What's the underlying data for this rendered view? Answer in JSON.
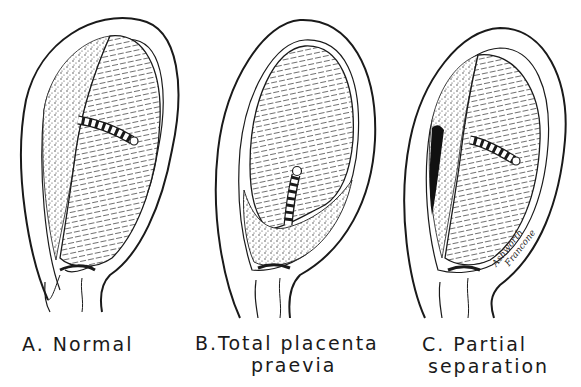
{
  "figure": {
    "panels": [
      {
        "id": "a",
        "letter": "A.",
        "caption_lines": [
          "A. Normal"
        ],
        "depiction": "uterus with placenta attached high on upper wall, umbilical cord, closed cervix"
      },
      {
        "id": "b",
        "letter": "B.",
        "caption_lines": [
          "B.Total placenta",
          "praevia"
        ],
        "depiction": "uterus with placenta covering the cervical os at the bottom"
      },
      {
        "id": "c",
        "letter": "C.",
        "caption_lines": [
          "C. Partial",
          "separation"
        ],
        "depiction": "uterus with partially separated placenta and dark retroplacental blood clot"
      }
    ],
    "signature_lines": [
      "Ashworth",
      "Francone"
    ],
    "colors": {
      "ink": "#1a1a1a",
      "paper": "#ffffff",
      "clot": "#111111",
      "placenta_stipple": "#3a3a3a"
    }
  }
}
